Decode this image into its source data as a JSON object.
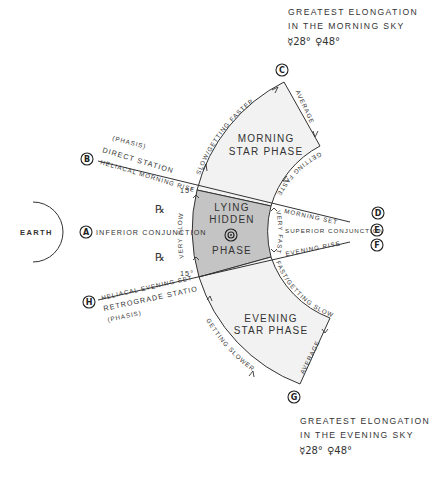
{
  "title_morning": {
    "line1": "GREATEST ELONGATION",
    "line2": "IN THE MORNING SKY",
    "mercury": "☿28°",
    "venus": "♀48°"
  },
  "title_evening": {
    "line1": "GREATEST ELONGATION",
    "line2": "IN THE EVENING SKY",
    "mercury": "☿28°",
    "venus": "♀48°"
  },
  "earth_label": "EARTH",
  "phases": {
    "morning": [
      "MORNING",
      "STAR PHASE"
    ],
    "hidden": [
      "LYING",
      "HIDDEN",
      "PHASE"
    ],
    "evening": [
      "EVENING",
      "STAR PHASE"
    ],
    "sun_symbol": "☉"
  },
  "points": {
    "A": {
      "letter": "A",
      "label": "INFERIOR CONJUNCTION"
    },
    "B": {
      "letter": "B",
      "label": "HELIACAL MORNING RISE",
      "label2": "DIRECT STATION",
      "label3": "(PHASIS)"
    },
    "C": {
      "letter": "C"
    },
    "D": {
      "letter": "D",
      "label": "MORNING SET"
    },
    "E": {
      "letter": "E",
      "label": "SUPERIOR CONJUNCTION"
    },
    "F": {
      "letter": "F",
      "label": "EVENING RISE"
    },
    "G": {
      "letter": "G"
    },
    "H": {
      "letter": "H",
      "label": "HELIACAL EVENING SET",
      "label2": "RETROGRADE STATION",
      "label3": "(PHASIS)"
    }
  },
  "speed_labels": {
    "slow_getting_faster": "SLOW/GETTING FASTER",
    "average_top": "AVERAGE",
    "getting_faster": "GETTING FASTER",
    "very_slow": "VERY SLOW",
    "very_fast": "VERY FAST",
    "fast_getting_slower": "FAST/GETTING SLOWER",
    "getting_slower": "GETTING SLOWER",
    "average_bottom": "AVERAGE"
  },
  "angles": {
    "top": "15°",
    "bottom": "15°"
  },
  "retrograde_symbol": "℞",
  "colors": {
    "hidden_fill": "#c4c4c4",
    "phase_fill": "#f2f2f2",
    "stroke": "#333333"
  }
}
